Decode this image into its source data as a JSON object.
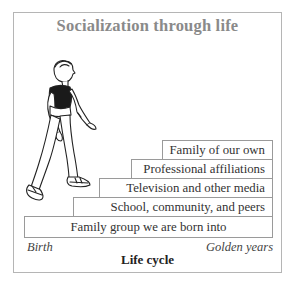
{
  "diagram": {
    "title": "Socialization through life",
    "steps": [
      {
        "label": "Family group we are born into"
      },
      {
        "label": "School, community, and peers"
      },
      {
        "label": "Television and other media"
      },
      {
        "label": "Professional affiliations"
      },
      {
        "label": "Family of our own"
      }
    ],
    "axis": {
      "start_label": "Birth",
      "end_label": "Golden years",
      "title": "Life cycle"
    },
    "illustration": "boy-climbing-stairs"
  }
}
